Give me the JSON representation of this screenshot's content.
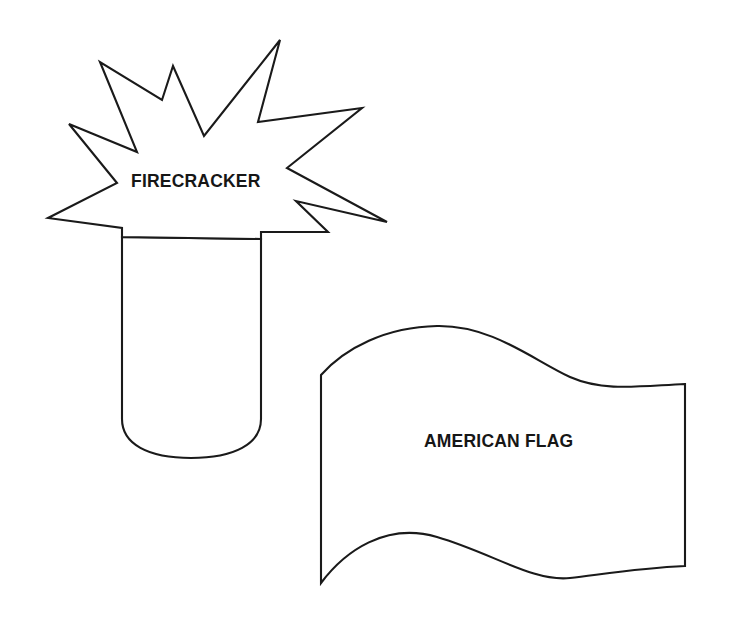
{
  "page": {
    "background_color": "#ffffff",
    "ink_color": "#1a1a1a",
    "text_color": "#161616",
    "width": 733,
    "height": 627
  },
  "shapes": [
    {
      "id": "firecracker",
      "label": "FIRECRACKER",
      "icon_name": "firecracker-outline-icon",
      "description": "Cylindrical firecracker tube with rounded bottom topped by a jagged starburst explosion",
      "label_position": {
        "x": 131,
        "y": 171
      }
    },
    {
      "id": "american-flag",
      "label": "AMERICAN FLAG",
      "icon_name": "waving-flag-outline-icon",
      "description": "Rectangular flag with wavy top and bottom edges, as if rippling in the wind",
      "label_position": {
        "x": 424,
        "y": 431
      }
    }
  ]
}
